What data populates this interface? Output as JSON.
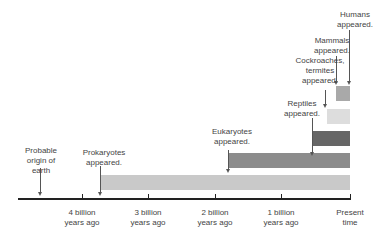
{
  "diagram": {
    "events": [
      {
        "label": "Probable\norigin of\nearth"
      },
      {
        "label": "Prokaryotes\nappeared."
      },
      {
        "label": "Eukaryotes\nappeared."
      },
      {
        "label": "Reptiles\nappeared."
      },
      {
        "label": "Cockroaches,\ntermites\nappeared."
      },
      {
        "label": "Mammals\nappeared."
      },
      {
        "label": "Humans\nappeared."
      }
    ],
    "axis_ticks": [
      {
        "label": "4 billion\nyears ago"
      },
      {
        "label": "3 billion\nyears ago"
      },
      {
        "label": "2 billion\nyears ago"
      },
      {
        "label": "1 billion\nyears ago"
      },
      {
        "label": "Present\ntime"
      }
    ],
    "bar_colors": {
      "prokaryotes": "#c9c9c9",
      "eukaryotes": "#8c8c8c",
      "reptiles": "#666666",
      "cockroaches": "#dddddd",
      "mammals": "#a9a9a9"
    }
  }
}
